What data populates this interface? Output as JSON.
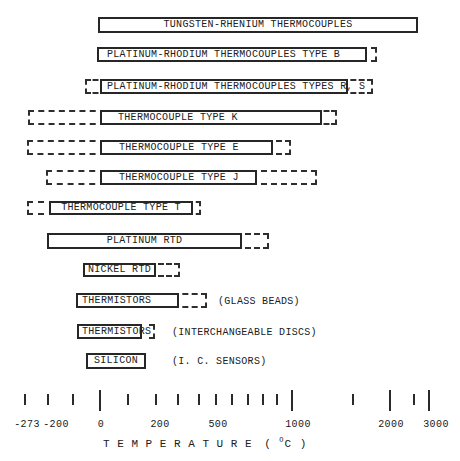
{
  "figure": {
    "background": "#ffffff",
    "ink_color": "#262626"
  },
  "chart_data": {
    "type": "bar",
    "subtype": "horizontal-range-bars",
    "title": "",
    "xlabel": "TEMPERATURE (°C)",
    "x_axis_scale": "nonlinear, compressed toward high temperatures",
    "xlim": [
      -273,
      3000
    ],
    "series": [
      {
        "name": "TUNGSTEN-RHENIUM THERMOCOUPLES",
        "note": null,
        "solid_range_c": [
          0,
          2600
        ],
        "extended_range_c": null
      },
      {
        "name": "PLATINUM-RHODIUM THERMOCOUPLES TYPE B",
        "note": null,
        "solid_range_c": [
          0,
          1700
        ],
        "extended_range_c": [
          0,
          1820
        ]
      },
      {
        "name": "PLATINUM-RHODIUM THERMOCOUPLES TYPES R, S",
        "note": null,
        "solid_range_c": [
          0,
          1450
        ],
        "extended_range_c": [
          -50,
          1750
        ]
      },
      {
        "name": "THERMOCOUPLE TYPE K",
        "note": null,
        "solid_range_c": [
          0,
          1250
        ],
        "extended_range_c": [
          -270,
          1370
        ]
      },
      {
        "name": "THERMOCOUPLE TYPE E",
        "note": null,
        "solid_range_c": [
          0,
          870
        ],
        "extended_range_c": [
          -270,
          1000
        ]
      },
      {
        "name": "THERMOCOUPLE TYPE J",
        "note": null,
        "solid_range_c": [
          0,
          760
        ],
        "extended_range_c": [
          -200,
          1200
        ]
      },
      {
        "name": "THERMOCOUPLE TYPE T",
        "note": null,
        "solid_range_c": [
          -200,
          370
        ],
        "extended_range_c": [
          -270,
          400
        ]
      },
      {
        "name": "PLATINUM RTD",
        "note": null,
        "solid_range_c": [
          -200,
          650
        ],
        "extended_range_c": [
          -200,
          850
        ]
      },
      {
        "name": "NICKEL RTD",
        "note": null,
        "solid_range_c": [
          -60,
          200
        ],
        "extended_range_c": [
          -60,
          300
        ]
      },
      {
        "name": "THERMISTORS",
        "note": "(GLASS BEADS)",
        "solid_range_c": [
          -90,
          300
        ],
        "extended_range_c": [
          -90,
          450
        ]
      },
      {
        "name": "THERMISTORS",
        "note": "(INTERCHANGEABLE DISCS)",
        "solid_range_c": [
          -85,
          150
        ],
        "extended_range_c": [
          -85,
          200
        ]
      },
      {
        "name": "SILICON",
        "note": "(I. C. SENSORS)",
        "solid_range_c": [
          -55,
          160
        ],
        "extended_range_c": null
      }
    ],
    "axis": {
      "title_spaced": "T E M P E R A T U R E",
      "unit_open": "( ",
      "unit_degree": "O",
      "unit_close": "C )",
      "tick_labels": [
        {
          "text": "-273",
          "x": 27
        },
        {
          "text": "-200",
          "x": 56
        },
        {
          "text": "0",
          "x": 101
        },
        {
          "text": "200",
          "x": 160
        },
        {
          "text": "500",
          "x": 218
        },
        {
          "text": "1000",
          "x": 298
        },
        {
          "text": "2000",
          "x": 391
        },
        {
          "text": "3000",
          "x": 436
        }
      ]
    },
    "layout": {
      "rows": [
        {
          "y": 17,
          "h": 16,
          "solid": [
            98,
            418
          ],
          "dash_left": null,
          "dash_right": null,
          "pad": null,
          "note_x": null
        },
        {
          "y": 47,
          "h": 15,
          "solid": [
            97,
            367
          ],
          "dash_left": null,
          "dash_right": [
            361,
            377
          ],
          "pad": 8,
          "note_x": null
        },
        {
          "y": 79,
          "h": 15,
          "solid": [
            100,
            348
          ],
          "dash_left": [
            85,
            106
          ],
          "dash_right": [
            342,
            373
          ],
          "pad": 5,
          "note_x": null
        },
        {
          "y": 110,
          "h": 15,
          "solid": [
            100,
            322
          ],
          "dash_left": [
            28,
            106
          ],
          "dash_right": [
            316,
            337
          ],
          "pad": 16,
          "note_x": null
        },
        {
          "y": 140,
          "h": 15,
          "solid": [
            100,
            273
          ],
          "dash_left": [
            27,
            106
          ],
          "dash_right": [
            267,
            291
          ],
          "pad": 17,
          "note_x": null
        },
        {
          "y": 170,
          "h": 15,
          "solid": [
            100,
            257
          ],
          "dash_left": [
            46,
            106
          ],
          "dash_right": [
            251,
            317
          ],
          "pad": 17,
          "note_x": null
        },
        {
          "y": 201,
          "h": 14,
          "solid": [
            49,
            193
          ],
          "dash_left": [
            27,
            55
          ],
          "dash_right": [
            187,
            201
          ],
          "pad": null,
          "note_x": null
        },
        {
          "y": 233,
          "h": 16,
          "solid": [
            47,
            242
          ],
          "dash_left": null,
          "dash_right": [
            236,
            269
          ],
          "pad": null,
          "note_x": null
        },
        {
          "y": 263,
          "h": 14,
          "solid": [
            83,
            156
          ],
          "dash_left": null,
          "dash_right": [
            150,
            180
          ],
          "pad": null,
          "note_x": null
        },
        {
          "y": 293,
          "h": 15,
          "solid": [
            76,
            179
          ],
          "dash_left": null,
          "dash_right": [
            173,
            207
          ],
          "pad": 4,
          "note_x": 218
        },
        {
          "y": 324,
          "h": 15,
          "solid": [
            77,
            142
          ],
          "dash_left": null,
          "dash_right": [
            136,
            155
          ],
          "pad": 3,
          "note_x": 172
        },
        {
          "y": 353,
          "h": 16,
          "solid": [
            86,
            146
          ],
          "dash_left": null,
          "dash_right": null,
          "pad": null,
          "note_x": 172
        }
      ],
      "ticks": [
        {
          "value": -273,
          "x": 25,
          "major": false
        },
        {
          "value": -200,
          "x": 48,
          "major": false
        },
        {
          "value": -100,
          "x": 73,
          "major": false
        },
        {
          "value": 0,
          "x": 100,
          "major": true
        },
        {
          "value": 100,
          "x": 128,
          "major": false
        },
        {
          "value": 200,
          "x": 156,
          "major": false
        },
        {
          "value": 300,
          "x": 178,
          "major": false
        },
        {
          "value": 400,
          "x": 199,
          "major": false
        },
        {
          "value": 500,
          "x": 216,
          "major": false
        },
        {
          "value": 600,
          "x": 232,
          "major": false
        },
        {
          "value": 700,
          "x": 248,
          "major": false
        },
        {
          "value": 800,
          "x": 263,
          "major": false
        },
        {
          "value": 900,
          "x": 277,
          "major": false
        },
        {
          "value": 1000,
          "x": 292,
          "major": true
        },
        {
          "value": 1500,
          "x": 353,
          "major": false
        },
        {
          "value": 2000,
          "x": 390,
          "major": true
        },
        {
          "value": 2500,
          "x": 414,
          "major": false
        },
        {
          "value": 3000,
          "x": 429,
          "major": true
        }
      ],
      "tick_major_y": 390,
      "tick_major_h": 21,
      "tick_minor_y": 394,
      "tick_minor_h": 11,
      "tick_label_y": 419
    }
  }
}
